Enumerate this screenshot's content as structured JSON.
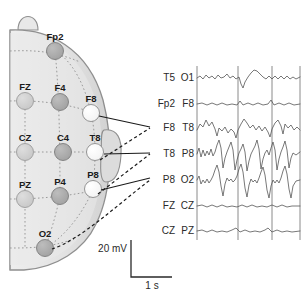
{
  "figure": {
    "head_diagram": {
      "view": "right-lateral-hemisphere",
      "nose_marker": "nose-bump",
      "ear_marker": "ear-outline",
      "fill_color": "#e3e3e3",
      "outline_color": "#8f8f8f",
      "grid_color": "#9a9a9a",
      "electrodes": [
        {
          "id": "Fp2",
          "label": "Fp2",
          "x": 55,
          "y": 51,
          "shade": "dark",
          "color": "#a8a8a8",
          "label_x": 55,
          "label_y": 39
        },
        {
          "id": "FZ",
          "label": "FZ",
          "x": 25,
          "y": 101,
          "shade": "light",
          "color": "#cfcfcf",
          "label_x": 25,
          "label_y": 89
        },
        {
          "id": "F4",
          "label": "F4",
          "x": 60,
          "y": 102,
          "shade": "dark",
          "color": "#a8a8a8",
          "label_x": 60,
          "label_y": 90
        },
        {
          "id": "F8",
          "label": "F8",
          "x": 91,
          "y": 113,
          "shade": "white",
          "color": "#fbfbfb",
          "label_x": 91,
          "label_y": 101
        },
        {
          "id": "CZ",
          "label": "CZ",
          "x": 25,
          "y": 152,
          "shade": "light",
          "color": "#cfcfcf",
          "label_x": 25,
          "label_y": 140
        },
        {
          "id": "C4",
          "label": "C4",
          "x": 63,
          "y": 152,
          "shade": "dark",
          "color": "#a8a8a8",
          "label_x": 63,
          "label_y": 140
        },
        {
          "id": "T8",
          "label": "T8",
          "x": 95,
          "y": 152,
          "shade": "white",
          "color": "#fbfbfb",
          "label_x": 95,
          "label_y": 140
        },
        {
          "id": "PZ",
          "label": "PZ",
          "x": 25,
          "y": 199,
          "shade": "light",
          "color": "#cfcfcf",
          "label_x": 25,
          "label_y": 187
        },
        {
          "id": "P4",
          "label": "P4",
          "x": 60,
          "y": 196,
          "shade": "dark",
          "color": "#a8a8a8",
          "label_x": 60,
          "label_y": 184
        },
        {
          "id": "P8",
          "label": "P8",
          "x": 93,
          "y": 189,
          "shade": "white",
          "color": "#fbfbfb",
          "label_x": 93,
          "label_y": 177
        },
        {
          "id": "O2",
          "label": "O2",
          "x": 45,
          "y": 248,
          "shade": "dark",
          "color": "#a8a8a8",
          "label_x": 45,
          "label_y": 236
        }
      ],
      "connectors": [
        {
          "from": "F8",
          "to_trace": "F8 T8",
          "style": "solid"
        },
        {
          "from": "T8",
          "to_trace": "T8 P8",
          "style": "solid"
        },
        {
          "from": "P8",
          "to_trace": "P8 O2",
          "style": "solid"
        },
        {
          "from": "F8",
          "to_trace": "F8 T8",
          "style": "dashed"
        },
        {
          "from": "T8",
          "to_trace": "T8 P8",
          "style": "dashed"
        },
        {
          "from": "O2",
          "to_trace": "P8 O2",
          "style": "dashed"
        }
      ]
    },
    "scale_bar": {
      "vertical_label": "20 mV",
      "horizontal_label": "1 s",
      "vertical_value": 20,
      "vertical_unit": "mV",
      "horizontal_value": 1,
      "horizontal_unit": "s"
    },
    "traces_panel": {
      "left_column_header": "",
      "right_column_header": "",
      "gridline_color": "#8a8a8a",
      "trace_color": "#555555",
      "vertical_gridlines_x": [
        197,
        238,
        272,
        300
      ],
      "channels": [
        {
          "left": "T5",
          "right": "O1",
          "baseline_y": 78,
          "amplitude": "low",
          "description": "low-amplitude background activity with one small downward deflection"
        },
        {
          "left": "Fp2",
          "right": "F8",
          "baseline_y": 104,
          "amplitude": "very-low",
          "description": "near-flat background"
        },
        {
          "left": "F8",
          "right": "T8",
          "baseline_y": 128,
          "amplitude": "medium",
          "description": "irregular sharp waves"
        },
        {
          "left": "T8",
          "right": "P8",
          "baseline_y": 154,
          "amplitude": "high",
          "description": "repetitive spike-and-slow-wave discharges"
        },
        {
          "left": "P8",
          "right": "O2",
          "baseline_y": 180,
          "amplitude": "high",
          "description": "repetitive spike-and-slow-wave discharges"
        },
        {
          "left": "FZ",
          "right": "CZ",
          "baseline_y": 206,
          "amplitude": "very-low",
          "description": "near-flat background"
        },
        {
          "left": "CZ",
          "right": "PZ",
          "baseline_y": 231,
          "amplitude": "very-low",
          "description": "near-flat background"
        }
      ]
    }
  }
}
